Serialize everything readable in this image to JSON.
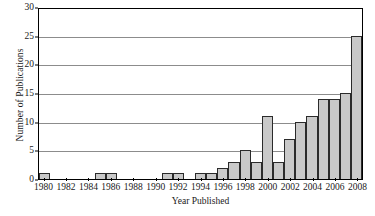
{
  "chart_data": {
    "type": "bar",
    "title": "",
    "subtitle": "",
    "xlabel": "Year Published",
    "ylabel": "Number of Publications",
    "categories": [
      "1980",
      "1981",
      "1982",
      "1983",
      "1984",
      "1985",
      "1986",
      "1987",
      "1988",
      "1989",
      "1990",
      "1991",
      "1992",
      "1993",
      "1994",
      "1995",
      "1996",
      "1997",
      "1998",
      "1999",
      "2000",
      "2001",
      "2002",
      "2003",
      "2004",
      "2005",
      "2006",
      "2007",
      "2008"
    ],
    "values": [
      1,
      0,
      0,
      0,
      0,
      1,
      1,
      0,
      0,
      0,
      0,
      1,
      1,
      0,
      1,
      1,
      2,
      3,
      5,
      3,
      11,
      3,
      7,
      10,
      11,
      14,
      14,
      15,
      25
    ],
    "x_tick_labels": [
      "1980",
      "1982",
      "1984",
      "1986",
      "1988",
      "1990",
      "1992",
      "1994",
      "1996",
      "1998",
      "2000",
      "2002",
      "2004",
      "2006",
      "2008"
    ],
    "y_tick_labels": [
      "0",
      "5",
      "10",
      "15",
      "20",
      "25",
      "30"
    ],
    "ylim": [
      0,
      30
    ],
    "y_major_step": 5,
    "grid": "horizontal",
    "legend": "none",
    "bar_fill_color": "#c9c9c9",
    "bar_edge_color": "#2b2b2b",
    "gridline_color": "#8c8c8c",
    "axis_color": "#000000",
    "background_color": "#ffffff"
  }
}
